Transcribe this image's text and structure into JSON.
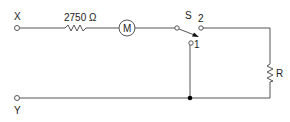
{
  "diagram": {
    "type": "circuit",
    "terminals": {
      "x_label": "X",
      "y_label": "Y"
    },
    "resistor_series": {
      "label": "2750 Ω"
    },
    "motor": {
      "label": "M"
    },
    "switch": {
      "label": "S",
      "position_1_label": "1",
      "position_2_label": "2"
    },
    "resistor_shunt": {
      "label": "R"
    },
    "colors": {
      "wire": "#555555",
      "text": "#222222",
      "junction": "#000000"
    }
  }
}
